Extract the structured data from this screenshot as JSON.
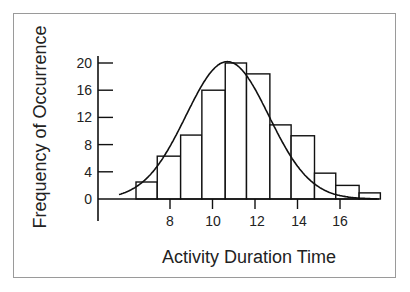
{
  "chart_data": {
    "type": "bar",
    "subtype": "histogram_with_normal_curve",
    "title": "",
    "xlabel": "Activity Duration Time",
    "ylabel": "Frequency of Occurrence",
    "x_ticks": [
      8,
      10,
      12,
      14,
      16
    ],
    "y_ticks": [
      0,
      4,
      8,
      12,
      16,
      20
    ],
    "xlim": [
      5,
      17.8
    ],
    "ylim": [
      0,
      20
    ],
    "bins": [
      {
        "from": 6.4,
        "to": 7.4,
        "value": 2.5
      },
      {
        "from": 7.4,
        "to": 8.5,
        "value": 6.3
      },
      {
        "from": 8.5,
        "to": 9.5,
        "value": 9.4
      },
      {
        "from": 9.5,
        "to": 10.6,
        "value": 16
      },
      {
        "from": 10.6,
        "to": 11.6,
        "value": 20
      },
      {
        "from": 11.6,
        "to": 12.7,
        "value": 18.4
      },
      {
        "from": 12.7,
        "to": 13.7,
        "value": 10.9
      },
      {
        "from": 13.7,
        "to": 14.8,
        "value": 9.3
      },
      {
        "from": 14.8,
        "to": 15.8,
        "value": 3.8
      },
      {
        "from": 15.8,
        "to": 16.9,
        "value": 2
      },
      {
        "from": 16.9,
        "to": 17.9,
        "value": 0.9
      }
    ],
    "categories": [
      "6.9",
      "8.0",
      "9.0",
      "10.1",
      "11.1",
      "12.2",
      "13.2",
      "14.3",
      "15.3",
      "16.4",
      "17.4"
    ],
    "values": [
      2.5,
      6.3,
      9.4,
      16,
      20,
      18.4,
      10.9,
      9.3,
      3.8,
      2,
      0.9
    ],
    "curve": {
      "type": "normal",
      "mean": 10.7,
      "peak": 20.2
    },
    "grid": false,
    "legend": null
  },
  "labels": {
    "x": "Activity Duration Time",
    "y": "Frequency of Occurrence",
    "yticks": [
      "20",
      "16",
      "12",
      "8",
      "4",
      "0"
    ],
    "xticks": [
      "8",
      "10",
      "12",
      "14",
      "16"
    ]
  }
}
